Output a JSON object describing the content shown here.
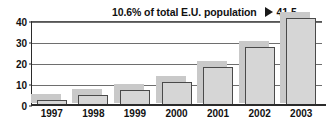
{
  "chart_data": {
    "type": "bar",
    "title": "",
    "subtitle": "",
    "xlabel": "",
    "ylabel": "",
    "categories": [
      "1997",
      "1998",
      "1999",
      "2000",
      "2001",
      "2002",
      "2003"
    ],
    "values": [
      2.5,
      5,
      7,
      11,
      18,
      27.5,
      41.5
    ],
    "ylim": [
      0,
      40
    ],
    "yticks": [
      0,
      10,
      20,
      30,
      40
    ],
    "ytick_labels": [
      "0",
      "10",
      "20",
      "30",
      "40"
    ],
    "grid": true,
    "legend": false,
    "legend_position": "none",
    "annotations": [
      {
        "text": "10.6% of total E.U. population",
        "marker": "right-triangle-marker",
        "value": "41.5",
        "target_category": "2003"
      }
    ],
    "colors": {
      "bar_fill": "#d6d6d6",
      "bar_outline": "#4a4a4a",
      "bar_shadow": "#c9c9c9",
      "axis": "#2b2b2b",
      "gridline": "#6e6e6e",
      "text": "#111111",
      "background": "#ffffff"
    }
  }
}
